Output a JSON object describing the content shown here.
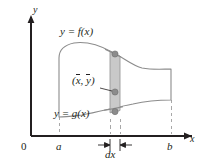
{
  "figure": {
    "axes": {
      "x_axis_label": "x",
      "y_axis_label": "y",
      "origin_label": "0"
    },
    "labels": {
      "upper_curve": "y = f(x)",
      "lower_curve": "y = g(x)",
      "centroid_x": "x",
      "centroid_y": "y",
      "centroid_open": "(",
      "centroid_comma": ", ",
      "centroid_close": ")",
      "strip_width": "dx",
      "left_bound": "a",
      "right_bound": "b"
    },
    "colors": {
      "ink": "#231f20",
      "curve_stroke": "#8c8c8c",
      "strip_fill": "#c9c9c9",
      "strip_stroke": "#9a9a9a",
      "dot_fill": "#8c8c8c",
      "dashed": "#a8a8a8",
      "background": "#ffffff"
    },
    "geometry": {
      "x_axis_y": 136,
      "y_axis_x": 31,
      "a_x": 59,
      "b_x": 171,
      "strip_left_x": 110,
      "strip_right_x": 120,
      "strip_top_y": 52,
      "strip_bottom_y": 118,
      "centroid_dot_y": 92
    }
  }
}
